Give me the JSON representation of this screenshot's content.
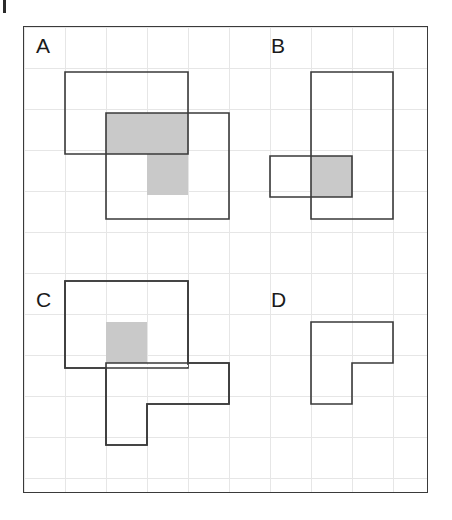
{
  "figure": {
    "type": "geometry-puzzle",
    "grid": {
      "cell_size_px": 41,
      "columns": 10,
      "rows": 11,
      "line_color": "#e6e6e6",
      "frame_color": "#3a3a3a",
      "background": "#ffffff"
    },
    "colors": {
      "shade_fill": "#c9c9c9",
      "outline": "#3a3a3a",
      "label_text": "#1a1a1a"
    },
    "panels": [
      {
        "id": "A",
        "label": "A",
        "label_x": 12,
        "label_y": 8,
        "has_shaded_overlap": true,
        "shaded_cells": 3,
        "rects": [
          {
            "name": "upper-left-rect",
            "x": 41,
            "y": 45,
            "w": 123,
            "h": 82
          },
          {
            "name": "lower-right-rect",
            "x": 82,
            "y": 86,
            "w": 123,
            "h": 106
          }
        ],
        "overlap": {
          "x": 82,
          "y": 86,
          "w": 82,
          "h": 41,
          "note": "L-shaped grey region formed by the intersection"
        }
      },
      {
        "id": "B",
        "label": "B",
        "label_x": 247,
        "label_y": 8,
        "has_shaded_overlap": true,
        "shaded_cells": 1,
        "rects": [
          {
            "name": "tall-rect",
            "x": 287,
            "y": 45,
            "w": 82,
            "h": 147
          },
          {
            "name": "wide-rect",
            "x": 246,
            "y": 129,
            "w": 82,
            "h": 41
          }
        ],
        "overlap": {
          "x": 287,
          "y": 129,
          "w": 41,
          "h": 41
        }
      },
      {
        "id": "C",
        "label": "C",
        "label_x": 12,
        "label_y": 262,
        "has_shaded_overlap": true,
        "shaded_cells": 1,
        "rects": [
          {
            "name": "upper-rect",
            "x": 41,
            "y": 254,
            "w": 123,
            "h": 87
          },
          {
            "name": "lower-l-shape",
            "x": 82,
            "y": 336,
            "w": 123,
            "h": 82
          }
        ],
        "overlap": {
          "x": 82,
          "y": 295,
          "w": 41,
          "h": 41
        }
      },
      {
        "id": "D",
        "label": "D",
        "label_x": 247,
        "label_y": 262,
        "has_shaded_overlap": false,
        "shaded_cells": 0,
        "rects": [
          {
            "name": "l-shape",
            "x": 287,
            "y": 295,
            "w": 82,
            "h": 82
          }
        ],
        "overlap": null
      }
    ]
  }
}
